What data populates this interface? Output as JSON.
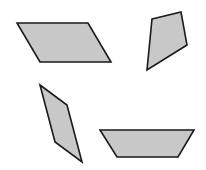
{
  "canvas": {
    "width": 206,
    "height": 170,
    "background": "#ffffff"
  },
  "style": {
    "fill": "#c8c8c8",
    "stroke": "#1a1a1a",
    "stroke_width": 1.6
  },
  "shapes": [
    {
      "name": "parallelogram",
      "points": "17,23 88,23 111,62 40,62"
    },
    {
      "name": "kite-quadrilateral",
      "points": "152,19 181,12 187,45 147,70"
    },
    {
      "name": "rhombus",
      "points": "40,85 67,105 82,162 55,142"
    },
    {
      "name": "trapezoid",
      "points": "100,130 194,130 178,157 117,157"
    }
  ]
}
